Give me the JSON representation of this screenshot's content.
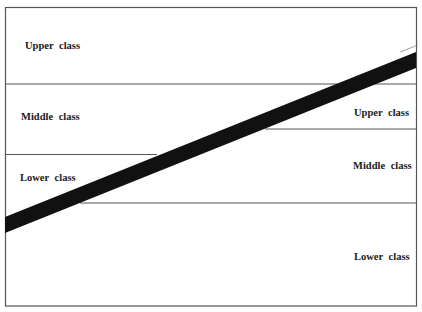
{
  "diagram": {
    "left_labels": [
      "Upper class",
      "Middle class",
      "Lower class"
    ],
    "right_labels": [
      "Upper class",
      "Middle class",
      "Lower class"
    ],
    "colors": {
      "border": "#555555",
      "band": "#111111",
      "text": "#1a1a1a"
    }
  }
}
